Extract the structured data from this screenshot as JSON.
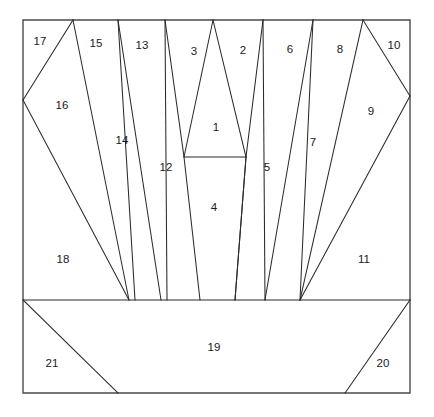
{
  "figure": {
    "canvas": {
      "width": 434,
      "height": 417
    },
    "colors": {
      "background": "#ffffff",
      "stroke": "#2b2b2b",
      "frame_stroke": "#4a4a4a",
      "label": "#1a1a1a",
      "face": "#ffffff"
    },
    "frame": {
      "x": 23,
      "y": 20,
      "width": 387,
      "height": 373
    },
    "divider_y": 300,
    "region_count": 21
  },
  "regions": [
    {
      "id": 1,
      "label": "1",
      "label_x": 216,
      "label_y": 128,
      "points": "184,157 213,20 246,157"
    },
    {
      "id": 2,
      "label": "2",
      "label_x": 243,
      "label_y": 51,
      "points": "213,20 263,20 246,157 235,300 228,300"
    },
    {
      "id": 3,
      "label": "3",
      "label_x": 194,
      "label_y": 52,
      "points": "165,20 213,20 184,157 200,300 194,300"
    },
    {
      "id": 4,
      "label": "4",
      "label_x": 214,
      "label_y": 208,
      "points": "184,157 246,157 235,300 200,300"
    },
    {
      "id": 5,
      "label": "5",
      "label_x": 267,
      "label_y": 168,
      "points": "263,20 246,157 235,300 265,300"
    },
    {
      "id": 6,
      "label": "6",
      "label_x": 290,
      "label_y": 50,
      "points": "263,20 313,20 265,300 259,300"
    },
    {
      "id": 7,
      "label": "7",
      "label_x": 313,
      "label_y": 143,
      "points": "313,20 300,300 265,300"
    },
    {
      "id": 8,
      "label": "8",
      "label_x": 340,
      "label_y": 50,
      "points": "313,20 363,20 300,300"
    },
    {
      "id": 9,
      "label": "9",
      "label_x": 371,
      "label_y": 112,
      "points": "363,20 410,96 300,300"
    },
    {
      "id": 10,
      "label": "10",
      "label_x": 394,
      "label_y": 46,
      "points": "363,20 410,20 410,96"
    },
    {
      "id": 11,
      "label": "11",
      "label_x": 364,
      "label_y": 260,
      "points": "410,96 410,300 300,300"
    },
    {
      "id": 12,
      "label": "12",
      "label_x": 166,
      "label_y": 168,
      "points": "165,20 184,157 200,300 167,300"
    },
    {
      "id": 13,
      "label": "13",
      "label_x": 142,
      "label_y": 46,
      "points": "118,20 165,20 167,300 161,300"
    },
    {
      "id": 14,
      "label": "14",
      "label_x": 122,
      "label_y": 141,
      "points": "118,20 161,300 135,300"
    },
    {
      "id": 15,
      "label": "15",
      "label_x": 96,
      "label_y": 44,
      "points": "73,20 118,20 135,300 129,300"
    },
    {
      "id": 16,
      "label": "16",
      "label_x": 62,
      "label_y": 106,
      "points": "73,20 129,300 23,100"
    },
    {
      "id": 17,
      "label": "17",
      "label_x": 40,
      "label_y": 42,
      "points": "23,20 73,20 23,100"
    },
    {
      "id": 18,
      "label": "18",
      "label_x": 63,
      "label_y": 260,
      "points": "23,100 129,300 23,300"
    },
    {
      "id": 19,
      "label": "19",
      "label_x": 214,
      "label_y": 348,
      "points": "23,300 410,300 345,393 118,393"
    },
    {
      "id": 20,
      "label": "20",
      "label_x": 383,
      "label_y": 364,
      "points": "410,300 410,393 345,393"
    },
    {
      "id": 21,
      "label": "21",
      "label_x": 52,
      "label_y": 364,
      "points": "23,300 118,393 23,393"
    }
  ],
  "edges": [
    {
      "name": "frame-rect",
      "d": "M 23 20 L 410 20 L 410 393 L 23 393 Z"
    },
    {
      "name": "divider-horizontal",
      "d": "M 23 300 L 410 300"
    },
    {
      "name": "small-quad-top",
      "d": "M 184 157 L 246 157"
    },
    {
      "name": "edge-17-16-left",
      "d": "M 73 20 L 23 100"
    },
    {
      "name": "edge-16-18",
      "d": "M 23 100 L 129 300"
    },
    {
      "name": "edge-16-15",
      "d": "M 73 20 L 129 300"
    },
    {
      "name": "edge-15-14",
      "d": "M 118 20 L 135 300"
    },
    {
      "name": "edge-14-13",
      "d": "M 118 20 L 161 300"
    },
    {
      "name": "edge-13-12",
      "d": "M 165 20 L 167 300"
    },
    {
      "name": "edge-12-3",
      "d": "M 165 20 L 184 157 L 200 300"
    },
    {
      "name": "edge-3-1",
      "d": "M 213 20 L 184 157"
    },
    {
      "name": "edge-1-2",
      "d": "M 213 20 L 246 157"
    },
    {
      "name": "edge-2-5",
      "d": "M 263 20 L 246 157 L 235 300"
    },
    {
      "name": "edge-4-right",
      "d": "M 246 157 L 235 300"
    },
    {
      "name": "edge-5-6",
      "d": "M 263 20 L 265 300"
    },
    {
      "name": "edge-6-7",
      "d": "M 313 20 L 265 300"
    },
    {
      "name": "edge-7-8",
      "d": "M 313 20 L 300 300"
    },
    {
      "name": "edge-8-9",
      "d": "M 363 20 L 300 300"
    },
    {
      "name": "edge-9-10",
      "d": "M 363 20 L 410 96"
    },
    {
      "name": "edge-9-11",
      "d": "M 410 96 L 300 300"
    },
    {
      "name": "edge-21-19",
      "d": "M 23 300 L 118 393"
    },
    {
      "name": "edge-19-20",
      "d": "M 410 300 L 345 393"
    }
  ]
}
